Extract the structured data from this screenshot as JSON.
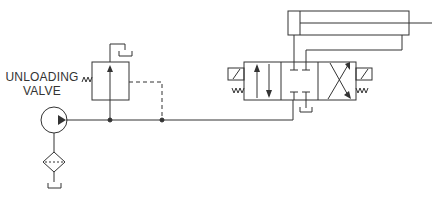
{
  "diagram": {
    "type": "hydraulic-schematic",
    "labels": {
      "unloading_valve_line1": "UNLOADING",
      "unloading_valve_line2": "VALVE"
    },
    "components": [
      {
        "id": "pump",
        "icon": "pump-icon"
      },
      {
        "id": "filter",
        "icon": "filter-icon"
      },
      {
        "id": "reservoir-pump",
        "icon": "tank-icon"
      },
      {
        "id": "unloading-valve",
        "icon": "unloading-valve-icon"
      },
      {
        "id": "reservoir-unloading",
        "icon": "tank-icon"
      },
      {
        "id": "directional-control-valve",
        "icon": "4-3-valve-icon"
      },
      {
        "id": "reservoir-dcv",
        "icon": "tank-icon"
      },
      {
        "id": "cylinder",
        "icon": "double-acting-cylinder-icon"
      }
    ],
    "colors": {
      "line": "#333333",
      "background": "#ffffff"
    }
  }
}
